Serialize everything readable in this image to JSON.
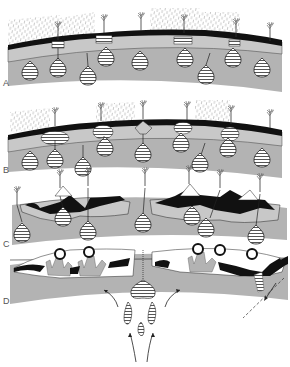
{
  "figure": {
    "panels": [
      {
        "id": "A",
        "label": "A",
        "label_pos": [
          3,
          79
        ]
      },
      {
        "id": "B",
        "label": "B",
        "label_pos": [
          3,
          166
        ]
      },
      {
        "id": "C",
        "label": "C",
        "label_pos": [
          3,
          240
        ]
      },
      {
        "id": "D",
        "label": "D",
        "label_pos": [
          3,
          297
        ]
      }
    ],
    "colors": {
      "background": "#ffffff",
      "mantle_gray": "#b3b3b3",
      "crust_light_gray": "#c8c8c8",
      "black_layer": "#111111",
      "rain": "#9a9a9a",
      "outline": "#222222",
      "magma_fill": "#ffffff",
      "magma_stripe": "#333333"
    },
    "icons": [
      "volcano-plume-icon",
      "magma-chamber-icon",
      "rain-icon",
      "flow-arrow-icon"
    ]
  }
}
